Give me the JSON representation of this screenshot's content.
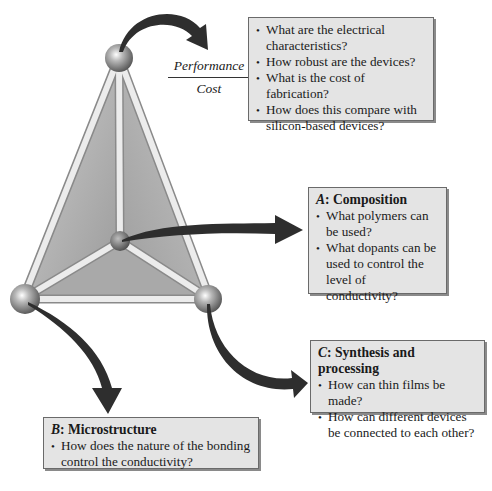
{
  "figure": {
    "type": "materials-science-tetrahedron",
    "vertices": [
      {
        "id": "apex",
        "label": "Performance / Cost"
      },
      {
        "id": "center",
        "label": "A: Composition"
      },
      {
        "id": "left",
        "label": "B: Microstructure"
      },
      {
        "id": "right",
        "label": "C: Synthesis and processing"
      }
    ]
  },
  "performance": {
    "numerator": "Performance",
    "denominator": "Cost",
    "items": [
      "What are the electrical characteristics?",
      "How robust are the devices?",
      "What is the cost of fabrication?",
      "How does this compare with silicon-based devices?"
    ]
  },
  "composition": {
    "letter": "A",
    "title": ": Composition",
    "items": [
      "What polymers can be used?",
      "What dopants can be used to control the level of conductivity?"
    ]
  },
  "synthesis": {
    "letter": "C",
    "title": ": Synthesis and processing",
    "items": [
      "How can thin films be made?",
      "How can different devices be connected to each other?"
    ]
  },
  "microstructure": {
    "letter": "B",
    "title": ": Microstructure",
    "items": [
      "How does the nature of the bonding control the conductivity?"
    ]
  },
  "colors": {
    "box_fill": "#e4e4e4",
    "box_border": "#6a6a6a",
    "arrow": "#2e2e2e",
    "face": "#a8a8a8",
    "rod": "#e8e8e8",
    "sphere": "#8a8a8a"
  }
}
